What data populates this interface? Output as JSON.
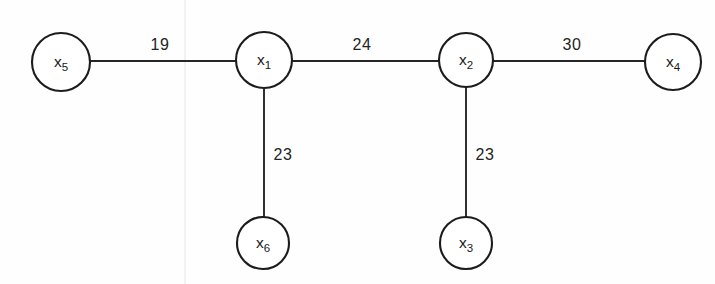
{
  "diagram": {
    "type": "weighted-undirected-graph",
    "background_color": "#fefefe",
    "stroke_color": "#1c1c1c",
    "label_color": "#1a1a1a",
    "canvas": {
      "width": 715,
      "height": 284
    },
    "nodes": [
      {
        "id": "x5",
        "base": "x",
        "subscript": "5",
        "cx": 61,
        "cy": 62,
        "r": 29
      },
      {
        "id": "x1",
        "base": "x",
        "subscript": "1",
        "cx": 264,
        "cy": 60,
        "r": 28
      },
      {
        "id": "x2",
        "base": "x",
        "subscript": "2",
        "cx": 466,
        "cy": 60,
        "r": 27
      },
      {
        "id": "x4",
        "base": "x",
        "subscript": "4",
        "cx": 673,
        "cy": 62,
        "r": 28
      },
      {
        "id": "x6",
        "base": "x",
        "subscript": "6",
        "cx": 263,
        "cy": 243,
        "r": 26
      },
      {
        "id": "x3",
        "base": "x",
        "subscript": "3",
        "cx": 466,
        "cy": 243,
        "r": 26
      }
    ],
    "edges": [
      {
        "id": "edge-x5-x1",
        "from": "x5",
        "to": "x1",
        "weight": "19",
        "x1": 90,
        "y1": 61,
        "x2": 236,
        "y2": 61,
        "label_x": 160,
        "label_y": 50
      },
      {
        "id": "edge-x1-x2",
        "from": "x1",
        "to": "x2",
        "weight": "24",
        "x1": 292,
        "y1": 61,
        "x2": 439,
        "y2": 61,
        "label_x": 362,
        "label_y": 50
      },
      {
        "id": "edge-x2-x4",
        "from": "x2",
        "to": "x4",
        "weight": "30",
        "x1": 493,
        "y1": 61,
        "x2": 645,
        "y2": 61,
        "label_x": 572,
        "label_y": 50
      },
      {
        "id": "edge-x1-x6",
        "from": "x1",
        "to": "x6",
        "weight": "23",
        "x1": 264,
        "y1": 88,
        "x2": 264,
        "y2": 217,
        "label_x": 283,
        "label_y": 160
      },
      {
        "id": "edge-x2-x3",
        "from": "x2",
        "to": "x3",
        "weight": "23",
        "x1": 466,
        "y1": 87,
        "x2": 466,
        "y2": 217,
        "label_x": 485,
        "label_y": 160
      }
    ],
    "artifacts": [
      {
        "id": "scan-fold-line",
        "x1": 185,
        "y1": 0,
        "x2": 185,
        "y2": 284
      }
    ]
  }
}
